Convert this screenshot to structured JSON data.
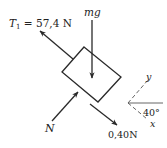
{
  "diagram": {
    "type": "free-body-diagram",
    "colors": {
      "stroke": "#2a2a2a",
      "text": "#222222",
      "axis": "#555555",
      "background": "#ffffff"
    },
    "forces": {
      "tension": {
        "symbol": "T",
        "subscript": "1",
        "value_text": " = 57,4 N"
      },
      "weight": {
        "label": "mg"
      },
      "normal": {
        "label": "N"
      },
      "friction": {
        "label": "0,40N"
      }
    },
    "axes": {
      "x_label": "x",
      "y_label": "y",
      "angle_label": "40°"
    }
  }
}
